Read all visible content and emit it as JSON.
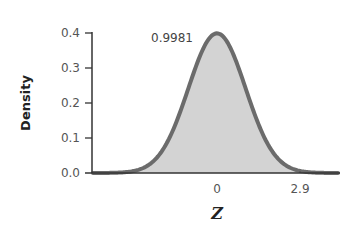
{
  "chart_data": {
    "type": "area",
    "title": "",
    "xlabel": "Z",
    "ylabel": "Density",
    "ylim": [
      0.0,
      0.4
    ],
    "yticks": [
      "0.0",
      "0.1",
      "0.2",
      "0.3",
      "0.4"
    ],
    "xticks": [
      "0",
      "2.9"
    ],
    "distribution": "standard normal",
    "shaded_region": {
      "from": "-inf",
      "to": 2.9,
      "area": 0.9981
    },
    "annotations": [
      {
        "text": "0.9981",
        "position": "left of peak"
      }
    ],
    "curve_color": "#6b6b6b",
    "fill_color": "#d3d3d3",
    "grid": false,
    "legend": null
  }
}
